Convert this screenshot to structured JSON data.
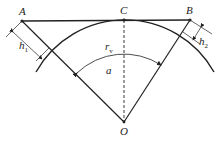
{
  "diagram": {
    "type": "geometry",
    "colors": {
      "stroke": "#222222",
      "background": "#ffffff"
    },
    "points": {
      "A": {
        "label": "A",
        "x": 22,
        "y": 21
      },
      "C": {
        "label": "C",
        "x": 124,
        "y": 20
      },
      "B": {
        "label": "B",
        "x": 190,
        "y": 20
      },
      "O": {
        "label": "O",
        "x": 124,
        "y": 122
      }
    },
    "labels": {
      "A": "A",
      "B": "B",
      "C": "C",
      "O": "O",
      "h1": "h",
      "h1_sub": "1",
      "h2": "h",
      "h2_sub": "2",
      "rv": "r",
      "rv_sub": "v",
      "angle": "a"
    },
    "segments": [
      {
        "from": "A",
        "to": "B",
        "style": "solid"
      },
      {
        "from": "A",
        "to": "O",
        "style": "solid"
      },
      {
        "from": "B",
        "to": "O",
        "style": "solid"
      },
      {
        "from": "C",
        "to": "O",
        "style": "dashed"
      }
    ],
    "arcs": [
      {
        "name": "main-arc",
        "center": "O",
        "radius": 102
      },
      {
        "name": "angle-arc",
        "center": "O",
        "radius": 68,
        "arrows": "both"
      }
    ],
    "dimensions": [
      {
        "name": "h1",
        "at": "A"
      },
      {
        "name": "h2",
        "at": "B"
      }
    ]
  }
}
